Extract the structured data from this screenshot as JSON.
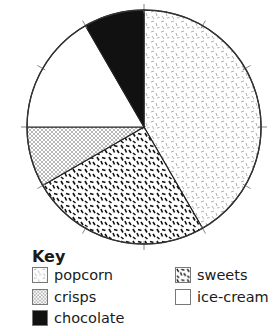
{
  "chart_data": {
    "type": "pie",
    "title": "",
    "start_angle_deg": 0,
    "direction": "clockwise",
    "tick_interval_deg": 30,
    "slices": [
      {
        "label": "popcorn",
        "degrees": 150,
        "fraction": 0.4167,
        "pattern": "light-gray-dashes"
      },
      {
        "label": "sweets",
        "degrees": 90,
        "fraction": 0.25,
        "pattern": "bold-black-dashes"
      },
      {
        "label": "crisps",
        "degrees": 30,
        "fraction": 0.0833,
        "pattern": "crosshatch"
      },
      {
        "label": "ice-cream",
        "degrees": 60,
        "fraction": 0.1667,
        "pattern": "white"
      },
      {
        "label": "chocolate",
        "degrees": 30,
        "fraction": 0.0833,
        "pattern": "solid-black"
      }
    ],
    "legend": {
      "title": "Key",
      "position": "bottom-left",
      "entries": [
        "popcorn",
        "crisps",
        "chocolate",
        "sweets",
        "ice-cream"
      ]
    }
  },
  "key": {
    "title": "Key",
    "items": [
      {
        "label": "popcorn"
      },
      {
        "label": "crisps"
      },
      {
        "label": "chocolate"
      },
      {
        "label": "sweets"
      },
      {
        "label": "ice-cream"
      }
    ]
  }
}
